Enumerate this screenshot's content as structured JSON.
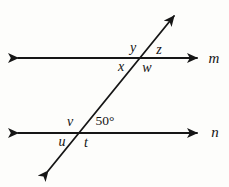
{
  "figure": {
    "colors": {
      "line": "#161616",
      "background": "#fdfdfb",
      "text": "#141414"
    },
    "line_labels": {
      "m": "m",
      "n": "n"
    },
    "top_intersection": {
      "upper_left": "y",
      "upper_right": "z",
      "lower_left": "x",
      "lower_right": "w"
    },
    "bottom_intersection": {
      "upper_left": "v",
      "upper_right": "50°",
      "lower_left": "u",
      "lower_right": "t"
    }
  }
}
